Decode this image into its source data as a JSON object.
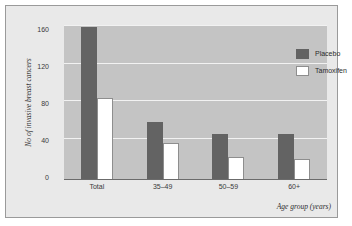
{
  "chart_data": {
    "type": "bar",
    "title": "",
    "subtitle": "",
    "xlabel": "Age group (years)",
    "ylabel": "No of invasive breast cancers",
    "categories": [
      "Total",
      "35–49",
      "50–59",
      "60+"
    ],
    "series": [
      {
        "name": "Placebo",
        "color": "#636363",
        "values": [
          158,
          60,
          47,
          48
        ]
      },
      {
        "name": "Tamoxifen",
        "color": "#ffffff",
        "values": [
          85,
          38,
          24,
          22
        ]
      }
    ],
    "ylim": [
      0,
      160
    ],
    "yticks": [
      "0",
      "40",
      "80",
      "120",
      "160"
    ],
    "ytick_values": [
      0,
      40,
      80,
      120,
      160
    ],
    "grid": true,
    "legend_position": "top-right"
  },
  "colors": {
    "page_background": "#ffffff",
    "frame_background": "#e9e9e9",
    "plot_background": "#c4c4c4",
    "gridline": "#f2f2f2",
    "axis": "#6b6b6b",
    "placebo_bar": "#636363",
    "tamoxifen_bar": "#ffffff",
    "text": "#2f2f2f"
  }
}
